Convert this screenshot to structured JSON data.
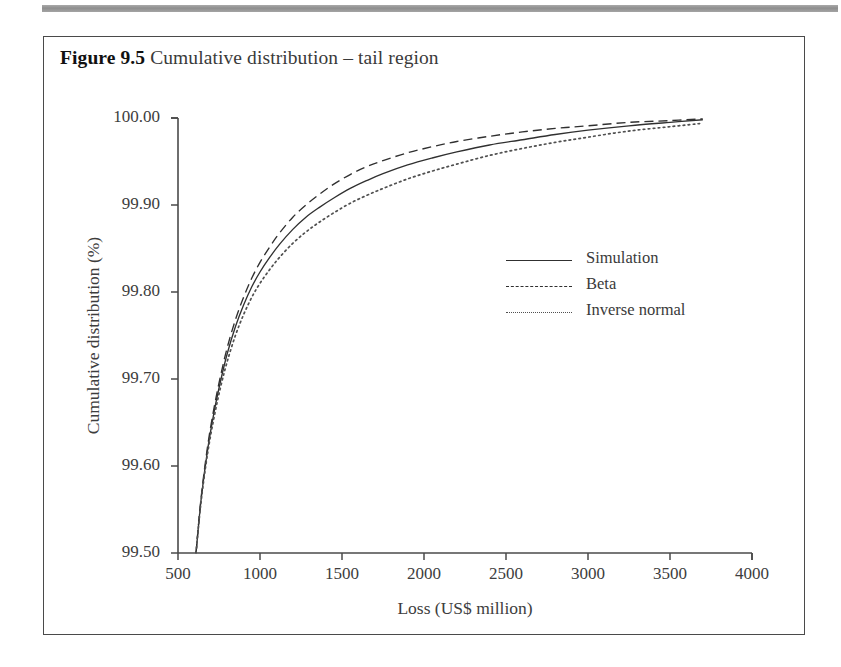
{
  "figure": {
    "label": "Figure 9.5",
    "title": "Cumulative distribution – tail region"
  },
  "chart_data": {
    "type": "line",
    "title": "Cumulative distribution – tail region",
    "xlabel": "Loss (US$ million)",
    "ylabel": "Cumulative distribution (%)",
    "xlim": [
      500,
      4000
    ],
    "ylim": [
      99.5,
      100.0
    ],
    "xticks": [
      500,
      1000,
      1500,
      2000,
      2500,
      3000,
      3500,
      4000
    ],
    "yticks": [
      "99.50",
      "99.60",
      "99.70",
      "99.80",
      "99.90",
      "100.00"
    ],
    "grid": false,
    "legend_position": "center-right",
    "series": [
      {
        "name": "Simulation",
        "style": "solid",
        "color": "#303030",
        "x": [
          610,
          640,
          680,
          720,
          760,
          800,
          850,
          900,
          950,
          1000,
          1060,
          1120,
          1200,
          1280,
          1360,
          1450,
          1550,
          1650,
          1750,
          1900,
          2050,
          2200,
          2400,
          2600,
          2800,
          3000,
          3250,
          3500,
          3700
        ],
        "y": [
          99.5,
          99.56,
          99.618,
          99.662,
          99.698,
          99.729,
          99.76,
          99.785,
          99.806,
          99.823,
          99.84,
          99.855,
          99.872,
          99.886,
          99.897,
          99.908,
          99.919,
          99.928,
          99.936,
          99.946,
          99.954,
          99.961,
          99.969,
          99.975,
          99.981,
          99.986,
          99.991,
          99.995,
          99.998
        ]
      },
      {
        "name": "Beta",
        "style": "dashed",
        "color": "#303030",
        "x": [
          610,
          640,
          680,
          720,
          760,
          800,
          850,
          900,
          950,
          1000,
          1060,
          1120,
          1200,
          1280,
          1360,
          1450,
          1550,
          1650,
          1750,
          1900,
          2050,
          2200,
          2400,
          2600,
          2800,
          3000,
          3250,
          3500,
          3700
        ],
        "y": [
          99.5,
          99.562,
          99.622,
          99.667,
          99.704,
          99.736,
          99.768,
          99.794,
          99.816,
          99.834,
          99.852,
          99.868,
          99.886,
          99.9,
          99.912,
          99.924,
          99.935,
          99.944,
          99.951,
          99.96,
          99.967,
          99.973,
          99.979,
          99.984,
          99.988,
          99.991,
          99.995,
          99.997,
          99.999
        ]
      },
      {
        "name": "Inverse normal",
        "style": "dotted",
        "color": "#505050",
        "x": [
          610,
          640,
          680,
          720,
          760,
          800,
          850,
          900,
          950,
          1000,
          1060,
          1120,
          1200,
          1280,
          1360,
          1450,
          1550,
          1650,
          1750,
          1900,
          2050,
          2200,
          2400,
          2600,
          2800,
          3000,
          3250,
          3500,
          3700
        ],
        "y": [
          99.5,
          99.558,
          99.614,
          99.656,
          99.691,
          99.72,
          99.75,
          99.774,
          99.794,
          99.81,
          99.826,
          99.84,
          99.856,
          99.869,
          99.88,
          99.891,
          99.902,
          99.911,
          99.919,
          99.93,
          99.939,
          99.947,
          99.957,
          99.965,
          99.972,
          99.978,
          99.985,
          99.99,
          99.994
        ]
      }
    ]
  }
}
